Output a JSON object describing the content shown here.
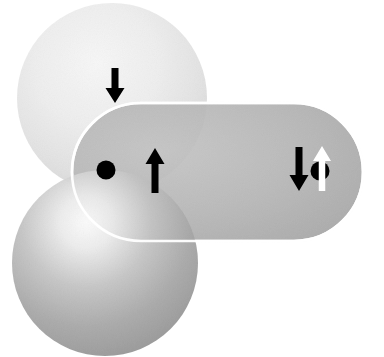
{
  "figure": {
    "canvas": {
      "width": 384,
      "height": 357,
      "background": "#ffffff"
    }
  },
  "shapes": [
    {
      "id": "sphere-upper-left",
      "name": "upper-left-sphere",
      "type": "sphere",
      "cx": 112,
      "cy": 98,
      "r": 95,
      "fill_center": "#f2f2f2",
      "fill_edge": "#d8d8d8",
      "highlight_x": "42%",
      "highlight_y": "32%",
      "opacity": 1
    },
    {
      "id": "capsule-right",
      "name": "horizontal-capsule-lobe",
      "type": "capsule",
      "x": 72,
      "y": 103,
      "width": 291,
      "height": 138,
      "rx": 69,
      "fill_center": "#bdbdbd",
      "fill_edge": "#a9a9a9",
      "stroke": "#ffffff",
      "stroke_width": 2.6,
      "opacity": 0.92
    },
    {
      "id": "sphere-lower-left",
      "name": "lower-left-sphere",
      "type": "sphere",
      "cx": 105,
      "cy": 263,
      "r": 93,
      "fill_center": "#f4f4f4",
      "fill_edge": "#9a9a9a",
      "highlight_x": "40%",
      "highlight_y": "28%",
      "opacity": 0.95
    }
  ],
  "markers": [
    {
      "id": "arrow-down-top",
      "name": "spin-down-arrow-top",
      "type": "arrow",
      "direction": "down",
      "color": "#000000",
      "x": 115,
      "y_top": 68,
      "y_bottom": 103,
      "shaft_width": 7,
      "head_width": 19,
      "head_height": 15
    },
    {
      "id": "dot-center",
      "name": "nucleus-dot",
      "type": "dot",
      "color": "#000000",
      "cx": 106,
      "cy": 170,
      "r": 9.5
    },
    {
      "id": "arrow-up-left",
      "name": "spin-up-arrow-left",
      "type": "arrow",
      "direction": "up",
      "color": "#000000",
      "x": 155,
      "y_top": 148,
      "y_bottom": 193,
      "shaft_width": 7,
      "head_width": 19,
      "head_height": 16
    },
    {
      "id": "arrow-down-right",
      "name": "spin-down-arrow-right",
      "type": "arrow",
      "direction": "down",
      "color": "#000000",
      "x": 299,
      "y_top": 147,
      "y_bottom": 191,
      "shaft_width": 7,
      "head_width": 19,
      "head_height": 16
    },
    {
      "id": "dot-right",
      "name": "nucleus-dot-right",
      "type": "dot",
      "color": "#000000",
      "cx": 320,
      "cy": 171,
      "r": 9.5
    },
    {
      "id": "arrow-up-right-white",
      "name": "spin-up-arrow-right-white",
      "type": "arrow",
      "direction": "up",
      "color": "#ffffff",
      "x": 322,
      "y_top": 146,
      "y_bottom": 191,
      "shaft_width": 6.5,
      "head_width": 18,
      "head_height": 15
    }
  ],
  "palette": {
    "background": "#ffffff",
    "sphere_light": "#e9e9e9",
    "sphere_mid": "#a8a8a8",
    "capsule": "#b4b4b4",
    "arrow_dark": "#000000",
    "arrow_light": "#ffffff",
    "outline": "#ffffff"
  }
}
